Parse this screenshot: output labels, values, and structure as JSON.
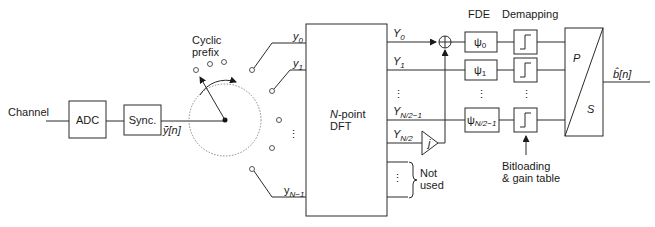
{
  "diagram": {
    "type": "block-diagram",
    "input_label": "Channel",
    "blocks": {
      "adc": "ADC",
      "sync": "Sync.",
      "dft_line1": "N",
      "dft_line1_rest": "-point",
      "dft_line2": "DFT",
      "ps_p": "P",
      "ps_s": "S"
    },
    "signals": {
      "sync_out": "ỹ[n]",
      "output": "b̂[n]"
    },
    "commutator": {
      "label_line1": "Cyclic",
      "label_line2": "prefix"
    },
    "dft_inputs": {
      "y0": "y",
      "y0_sub": "0",
      "y1": "y",
      "y1_sub": "1",
      "yN1": "y",
      "yN1_sub": "N−1"
    },
    "dft_outputs": {
      "Y0": "Y",
      "Y0_sub": "0",
      "Y1": "Y",
      "Y1_sub": "1",
      "YN21": "Y",
      "YN21_sub": "N/2−1",
      "YN2": "Y",
      "YN2_sub": "N/2"
    },
    "amplifier_label": "j",
    "not_used_line1": "Not",
    "not_used_line2": "used",
    "section_headers": {
      "fde": "FDE",
      "demapping": "Demapping"
    },
    "fde_blocks": [
      {
        "sym": "ψ",
        "sub": "0"
      },
      {
        "sym": "ψ",
        "sub": "1"
      },
      {
        "sym": "ψ",
        "sub": "N/2−1"
      }
    ],
    "bitloading_line1": "Bitloading",
    "bitloading_line2": "& gain table",
    "ellipsis": "⋮"
  }
}
